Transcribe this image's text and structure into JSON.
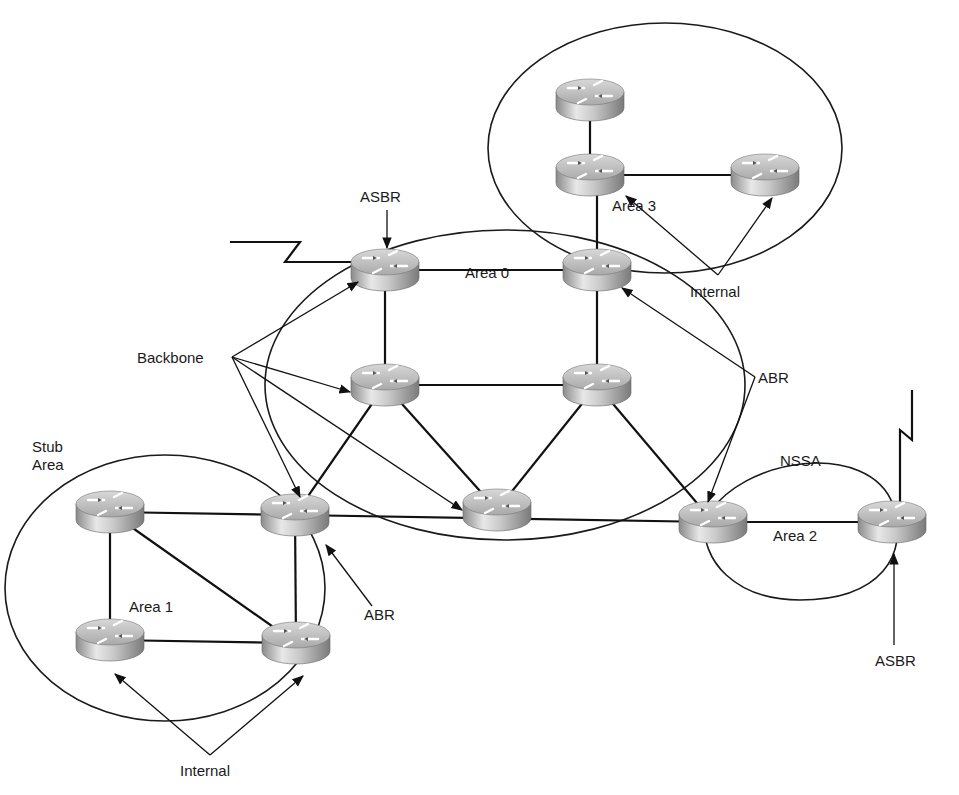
{
  "diagram": {
    "type": "OSPF network topology",
    "labels": {
      "area0": "Area 0",
      "area1": "Area 1",
      "area2": "Area 2",
      "area3": "Area 3",
      "stub_area_line1": "Stub",
      "stub_area_line2": "Area",
      "nssa": "NSSA",
      "backbone": "Backbone",
      "asbr_top": "ASBR",
      "asbr_bottom": "ASBR",
      "abr_right": "ABR",
      "abr_bottom": "ABR",
      "internal_top": "Internal",
      "internal_bottom": "Internal"
    },
    "routers": [
      {
        "id": "r3-top",
        "x": 590,
        "y": 100,
        "area": "Area 3",
        "role": "Internal"
      },
      {
        "id": "r3-left",
        "x": 590,
        "y": 175,
        "area": "Area 3",
        "role": "Internal"
      },
      {
        "id": "r3-right",
        "x": 765,
        "y": 175,
        "area": "Area 3",
        "role": "Internal"
      },
      {
        "id": "r0-asbr",
        "x": 385,
        "y": 270,
        "area": "Area 0",
        "role": "ASBR / Backbone"
      },
      {
        "id": "r0-abr-top",
        "x": 597,
        "y": 270,
        "area": "Area 0",
        "role": "ABR"
      },
      {
        "id": "r0-mid-left",
        "x": 385,
        "y": 385,
        "area": "Area 0",
        "role": "Backbone"
      },
      {
        "id": "r0-mid-right",
        "x": 597,
        "y": 385,
        "area": "Area 0",
        "role": "Backbone"
      },
      {
        "id": "r0-bottom",
        "x": 497,
        "y": 510,
        "area": "Area 0",
        "role": "Backbone"
      },
      {
        "id": "r1-abr",
        "x": 295,
        "y": 515,
        "area": "Area 1 / Area 0",
        "role": "ABR / Backbone"
      },
      {
        "id": "r1-top-left",
        "x": 110,
        "y": 512,
        "area": "Area 1",
        "role": "Internal"
      },
      {
        "id": "r1-bottom-left",
        "x": 110,
        "y": 640,
        "area": "Area 1",
        "role": "Internal"
      },
      {
        "id": "r1-bottom-right",
        "x": 296,
        "y": 643,
        "area": "Area 1",
        "role": "Internal"
      },
      {
        "id": "r2-abr",
        "x": 713,
        "y": 522,
        "area": "Area 2 / Area 0",
        "role": "ABR"
      },
      {
        "id": "r2-asbr",
        "x": 892,
        "y": 522,
        "area": "Area 2",
        "role": "ASBR"
      }
    ]
  }
}
